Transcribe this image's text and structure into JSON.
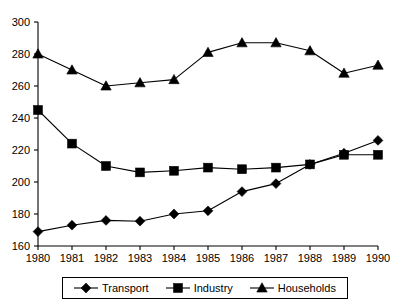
{
  "chart_data": {
    "type": "line",
    "title": "",
    "subtitle": "",
    "xlabel": "",
    "ylabel": "",
    "x": [
      1980,
      1981,
      1982,
      1983,
      1984,
      1985,
      1986,
      1987,
      1988,
      1989,
      1990
    ],
    "categories": [
      "1980",
      "1981",
      "1982",
      "1983",
      "1984",
      "1985",
      "1986",
      "1987",
      "1988",
      "1989",
      "1990"
    ],
    "xlim": [
      1980,
      1990
    ],
    "ylim": [
      160,
      300
    ],
    "yticks": [
      160,
      180,
      200,
      220,
      240,
      260,
      280,
      300
    ],
    "xticks": [
      "1980",
      "1981",
      "1982",
      "1983",
      "1984",
      "1985",
      "1986",
      "1987",
      "1988",
      "1989",
      "1990"
    ],
    "grid": false,
    "legend_position": "bottom",
    "series": [
      {
        "name": "Transport",
        "marker": "diamond",
        "color": "#000000",
        "values": [
          169,
          173,
          176,
          175.5,
          180,
          182,
          194,
          199,
          211,
          218,
          226
        ]
      },
      {
        "name": "Industry",
        "marker": "square",
        "color": "#000000",
        "values": [
          245,
          224,
          210,
          206,
          207,
          209,
          208,
          209,
          211,
          217,
          217
        ]
      },
      {
        "name": "Households",
        "marker": "triangle",
        "color": "#000000",
        "values": [
          280,
          270,
          260,
          262,
          264,
          281,
          287,
          287,
          282,
          268,
          273
        ]
      }
    ]
  },
  "legend": {
    "items": [
      {
        "label": "Transport",
        "marker": "diamond"
      },
      {
        "label": "Industry",
        "marker": "square"
      },
      {
        "label": "Households",
        "marker": "triangle"
      }
    ]
  }
}
